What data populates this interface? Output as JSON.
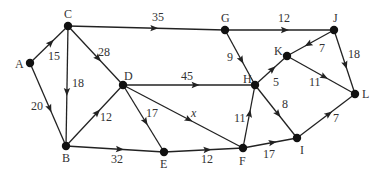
{
  "diagram": {
    "type": "directed weighted graph",
    "nodes": [
      {
        "id": "A",
        "x": 30,
        "y": 63,
        "lx": 15,
        "ly": 68
      },
      {
        "id": "C",
        "x": 68,
        "y": 26,
        "lx": 64,
        "ly": 18
      },
      {
        "id": "D",
        "x": 123,
        "y": 85,
        "lx": 124,
        "ly": 80
      },
      {
        "id": "G",
        "x": 225,
        "y": 30,
        "lx": 221,
        "ly": 22
      },
      {
        "id": "J",
        "x": 334,
        "y": 30,
        "lx": 333,
        "ly": 22
      },
      {
        "id": "K",
        "x": 287,
        "y": 56,
        "lx": 274,
        "ly": 55
      },
      {
        "id": "H",
        "x": 255,
        "y": 85,
        "lx": 243,
        "ly": 83
      },
      {
        "id": "L",
        "x": 355,
        "y": 94,
        "lx": 362,
        "ly": 98
      },
      {
        "id": "B",
        "x": 66,
        "y": 146,
        "lx": 62,
        "ly": 162
      },
      {
        "id": "E",
        "x": 164,
        "y": 152,
        "lx": 160,
        "ly": 168
      },
      {
        "id": "F",
        "x": 243,
        "y": 148,
        "lx": 239,
        "ly": 165
      },
      {
        "id": "I",
        "x": 297,
        "y": 138,
        "lx": 300,
        "ly": 154
      }
    ],
    "edges": [
      {
        "from": "A",
        "to": "C",
        "weight": "15",
        "lx": 48,
        "ly": 60
      },
      {
        "from": "A",
        "to": "B",
        "weight": "20",
        "lx": 31,
        "ly": 110
      },
      {
        "from": "C",
        "to": "B",
        "weight": "18",
        "lx": 72,
        "ly": 87
      },
      {
        "from": "C",
        "to": "D",
        "weight": "28",
        "lx": 98,
        "ly": 56
      },
      {
        "from": "C",
        "to": "G",
        "weight": "35",
        "lx": 152,
        "ly": 21
      },
      {
        "from": "B",
        "to": "D",
        "weight": "12",
        "lx": 100,
        "ly": 121
      },
      {
        "from": "B",
        "to": "E",
        "weight": "32",
        "lx": 111,
        "ly": 163
      },
      {
        "from": "D",
        "to": "E",
        "weight": "17",
        "lx": 146,
        "ly": 117
      },
      {
        "from": "D",
        "to": "H",
        "weight": "45",
        "lx": 181,
        "ly": 80
      },
      {
        "from": "D",
        "to": "F",
        "weight": "x",
        "lx": 191,
        "ly": 117,
        "variable": true
      },
      {
        "from": "E",
        "to": "F",
        "weight": "12",
        "lx": 201,
        "ly": 163
      },
      {
        "from": "F",
        "to": "H",
        "weight": "11",
        "lx": 234,
        "ly": 122
      },
      {
        "from": "F",
        "to": "I",
        "weight": "17",
        "lx": 263,
        "ly": 158
      },
      {
        "from": "G",
        "to": "J",
        "weight": "12",
        "lx": 278,
        "ly": 22
      },
      {
        "from": "G",
        "to": "H",
        "weight": "9",
        "lx": 227,
        "ly": 61
      },
      {
        "from": "H",
        "to": "K",
        "weight": "5",
        "lx": 273,
        "ly": 86
      },
      {
        "from": "H",
        "to": "I",
        "weight": "8",
        "lx": 282,
        "ly": 108
      },
      {
        "from": "J",
        "to": "K",
        "weight": "7",
        "lx": 319,
        "ly": 52
      },
      {
        "from": "J",
        "to": "L",
        "weight": "18",
        "lx": 348,
        "ly": 58
      },
      {
        "from": "K",
        "to": "L",
        "weight": "11",
        "lx": 309,
        "ly": 86
      },
      {
        "from": "I",
        "to": "L",
        "weight": "7",
        "lx": 333,
        "ly": 122
      }
    ]
  },
  "colors": {
    "background": "#ffffff",
    "edge": "#222222",
    "node": "#111111",
    "label": "#333333"
  }
}
